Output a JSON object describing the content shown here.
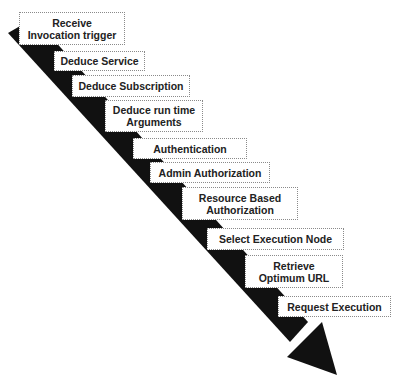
{
  "diagram": {
    "type": "staircase-process-flow",
    "arrow_color": "#111111",
    "box_border_color": "#8a8a8a",
    "text_color": "#222222",
    "steps": [
      {
        "label": "Receive\nInvocation trigger"
      },
      {
        "label": "Deduce Service"
      },
      {
        "label": "Deduce Subscription"
      },
      {
        "label": "Deduce run time\nArguments"
      },
      {
        "label": "Authentication"
      },
      {
        "label": "Admin Authorization"
      },
      {
        "label": "Resource Based\nAuthorization"
      },
      {
        "label": "Select Execution Node"
      },
      {
        "label": "Retrieve\nOptimum URL"
      },
      {
        "label": "Request Execution"
      }
    ]
  }
}
